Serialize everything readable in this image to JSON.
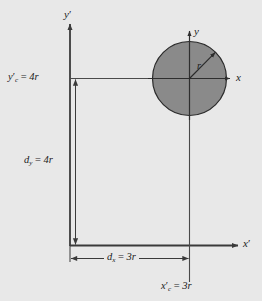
{
  "figure": {
    "type": "geometry-diagram",
    "background_color": "#e8e8e8",
    "shape_fill_color": "#8a8a8a",
    "line_color": "#3a3a3a",
    "text_color": "#1c1c1c"
  },
  "axes": {
    "reference_y": {
      "label_main": "y",
      "label_prime": "′",
      "name": "y-prime-axis"
    },
    "reference_x": {
      "label_main": "x",
      "label_prime": "′",
      "name": "x-prime-axis"
    },
    "local_y": {
      "label_main": "y",
      "name": "y-axis"
    },
    "local_x": {
      "label_main": "x",
      "name": "x-axis"
    }
  },
  "shape": {
    "name": "circle",
    "radius_label": "r",
    "center_x_px": 189,
    "center_y_px": 78,
    "radius_px": 37
  },
  "annotations": {
    "centroid_y": {
      "lead": "y",
      "prime": "′",
      "subscript": "c",
      "equals": " = ",
      "value": "4r",
      "full_text": "y′c = 4r"
    },
    "centroid_x": {
      "lead": "x",
      "prime": "′",
      "subscript": "c",
      "equals": " = ",
      "value": "3r",
      "full_text": "x′c = 3r"
    },
    "distance_y": {
      "lead": "d",
      "subscript": "y",
      "equals": " = ",
      "value": "4r",
      "full_text": "dy = 4r"
    },
    "distance_x": {
      "lead": "d",
      "subscript": "x",
      "equals": " = ",
      "value": "3r",
      "full_text": "dx = 3r"
    }
  }
}
